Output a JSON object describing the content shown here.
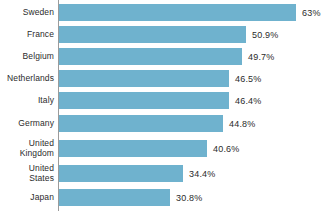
{
  "chart_data": {
    "type": "bar",
    "orientation": "horizontal",
    "title": "",
    "subtitle": "",
    "xlabel": "",
    "ylabel": "",
    "grid": false,
    "legend": "none",
    "axis_line": "left-vertical",
    "value_suffix": "%",
    "xlim": [
      0,
      63
    ],
    "categories": [
      "Sweden",
      "France",
      "Belgium",
      "Netherlands",
      "Italy",
      "United\nKingdom",
      "Germany",
      "United\nStates",
      "Japan"
    ],
    "values": [
      63,
      50.9,
      49.7,
      46.5,
      46.4,
      40.6,
      44.8,
      34.4,
      30.8
    ],
    "series": [
      {
        "name": "",
        "color": "#6FB2CE",
        "points": [
          {
            "category": "Sweden",
            "value": 63,
            "label": "63%"
          },
          {
            "category": "France",
            "value": 50.9,
            "label": "50.9%"
          },
          {
            "category": "Belgium",
            "value": 49.7,
            "label": "49.7%"
          },
          {
            "category": "Netherlands",
            "value": 46.5,
            "label": "46.5%"
          },
          {
            "category": "Italy",
            "value": 46.4,
            "label": "46.4%"
          },
          {
            "category": "Germany",
            "value": 44.8,
            "label": "44.8%"
          },
          {
            "category": "United Kingdom",
            "value": 40.6,
            "label": "40.6%"
          },
          {
            "category": "United States",
            "value": 34.4,
            "label": "34.4%"
          },
          {
            "category": "Japan",
            "value": 30.8,
            "label": "30.8%"
          }
        ]
      }
    ]
  },
  "rows": [
    {
      "label": "Sweden",
      "value_label": "63%",
      "bar_width_px": 237,
      "top": 4,
      "height": 17
    },
    {
      "label": "France",
      "value_label": "50.9%",
      "bar_width_px": 187,
      "top": 26,
      "height": 17
    },
    {
      "label": "Belgium",
      "value_label": "49.7%",
      "bar_width_px": 183,
      "top": 48,
      "height": 17
    },
    {
      "label": "Netherlands",
      "value_label": "46.5%",
      "bar_width_px": 170,
      "top": 70,
      "height": 17
    },
    {
      "label": "Italy",
      "value_label": "46.4%",
      "bar_width_px": 170,
      "top": 92,
      "height": 17
    },
    {
      "label": "Germany",
      "value_label": "44.8%",
      "bar_width_px": 164,
      "top": 115,
      "height": 17
    },
    {
      "label": "United\nKingdom",
      "value_label": "40.6%",
      "bar_width_px": 148,
      "top": 140,
      "height": 17
    },
    {
      "label": "United\nStates",
      "value_label": "34.4%",
      "bar_width_px": 124,
      "top": 165,
      "height": 17
    },
    {
      "label": "Japan",
      "value_label": "30.8%",
      "bar_width_px": 111,
      "top": 189,
      "height": 17
    }
  ],
  "colors": {
    "bar": "#6FB2CE",
    "axis": "#9b9b9b",
    "text": "#2b2b2b",
    "background": "#ffffff"
  }
}
